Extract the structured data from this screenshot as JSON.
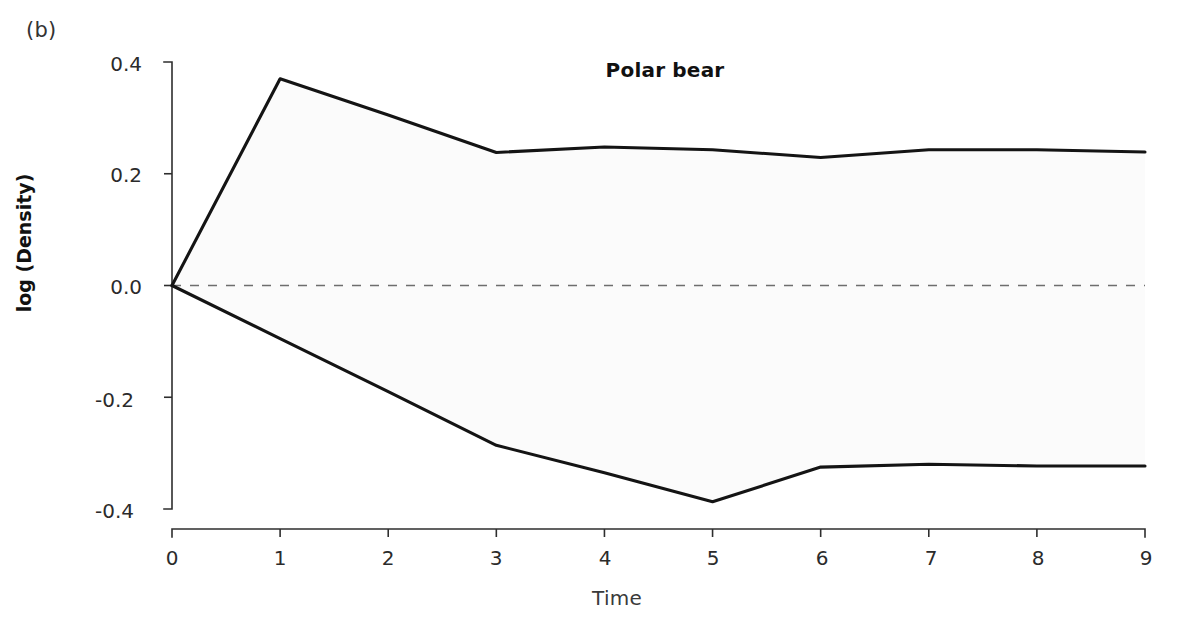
{
  "panel": {
    "label": "(b)"
  },
  "chart_data": {
    "type": "area",
    "title": "Polar bear",
    "xlabel": "Time",
    "ylabel": "log (Density)",
    "x": [
      0,
      1,
      2,
      3,
      4,
      5,
      6,
      7,
      8,
      9
    ],
    "xlim": [
      0,
      9
    ],
    "ylim": [
      -0.4,
      0.4
    ],
    "grid": false,
    "legend": "none",
    "xticks": [
      "0",
      "1",
      "2",
      "3",
      "4",
      "5",
      "6",
      "7",
      "8",
      "9"
    ],
    "yticks": [
      "0.4",
      "0.2",
      "0.0",
      "-0.2",
      "-0.4"
    ],
    "ytick_values": [
      0.4,
      0.2,
      0.0,
      -0.2,
      -0.4
    ],
    "series": [
      {
        "name": "upper bound",
        "values": [
          0.0,
          0.37,
          0.305,
          0.238,
          0.248,
          0.243,
          0.229,
          0.243,
          0.243,
          0.239
        ]
      },
      {
        "name": "lower bound",
        "values": [
          0.0,
          -0.095,
          -0.19,
          -0.286,
          -0.335,
          -0.387,
          -0.325,
          -0.32,
          -0.323,
          -0.323
        ]
      },
      {
        "name": "zero reference",
        "style": "dashed",
        "values": [
          0.0,
          0.0,
          0.0,
          0.0,
          0.0,
          0.0,
          0.0,
          0.0,
          0.0,
          0.0
        ]
      }
    ],
    "fill_color": "#fbfbfb",
    "line_color": "#141414",
    "reference_line_color": "#6e6e6e"
  }
}
